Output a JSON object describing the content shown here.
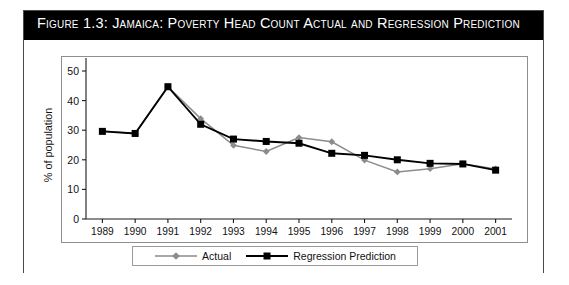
{
  "figure": {
    "title": "Figure 1.3: Jamaica: Poverty Head Count Actual and Regression Prediction",
    "frame_color": "#4a4a4a",
    "title_bar_color": "#000000",
    "title_text_color": "#ffffff"
  },
  "legend": {
    "actual_label": "Actual",
    "prediction_label": "Regression Prediction",
    "actual_color": "#8c8c8c",
    "prediction_color": "#000000"
  },
  "axis": {
    "y_title": "% of population",
    "y_ticks": [
      "0",
      "10",
      "20",
      "30",
      "40",
      "50"
    ],
    "x_ticks": [
      "1989",
      "1990",
      "1991",
      "1992",
      "1993",
      "1994",
      "1995",
      "1996",
      "1997",
      "1998",
      "1999",
      "2000",
      "2001"
    ]
  },
  "chart_data": {
    "type": "line",
    "title": "Figure 1.3: Jamaica: Poverty Head Count Actual and Regression Prediction",
    "xlabel": "",
    "ylabel": "% of population",
    "ylim": [
      0,
      50
    ],
    "ytick_step": 10,
    "grid": false,
    "legend_position": "bottom",
    "categories": [
      "1989",
      "1990",
      "1991",
      "1992",
      "1993",
      "1994",
      "1995",
      "1996",
      "1997",
      "1998",
      "1999",
      "2000",
      "2001"
    ],
    "series": [
      {
        "name": "Actual",
        "color": "#8c8c8c",
        "marker": "diamond",
        "values": [
          29.7,
          28.9,
          44.7,
          33.9,
          24.9,
          22.8,
          27.5,
          26.1,
          19.9,
          15.9,
          17.0,
          18.7,
          16.9
        ]
      },
      {
        "name": "Regression Prediction",
        "color": "#000000",
        "marker": "square",
        "values": [
          29.6,
          28.9,
          44.7,
          32.0,
          27.0,
          26.2,
          25.6,
          22.2,
          21.5,
          20.0,
          18.8,
          18.6,
          16.5
        ]
      }
    ]
  }
}
